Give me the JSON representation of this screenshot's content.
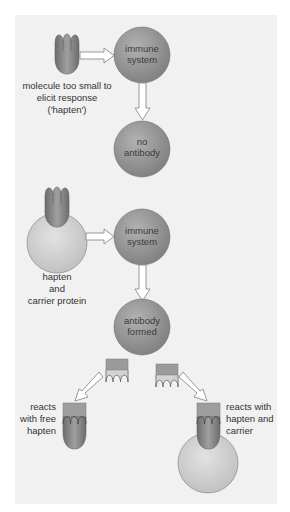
{
  "colors": {
    "panel": "#f1f1f1",
    "circle": "#8f8f8f",
    "circle_light": "#b4b4b4",
    "carrier": "#c9c9c9",
    "carrier_light": "#e4e4e4",
    "hapten": "#7a7a7a",
    "hapten_light": "#a5a5a5",
    "fab_box": "#9d9d9d",
    "arrow_fill": "#ffffff",
    "arrow_stroke": "#8c8c8c",
    "text": "#333333"
  },
  "nodes": {
    "immune_system_1": [
      "immune",
      "system"
    ],
    "no_antibody": [
      "no",
      "antibody"
    ],
    "immune_system_2": [
      "immune",
      "system"
    ],
    "antibody_formed": [
      "antibody",
      "formed"
    ]
  },
  "labels": {
    "hapten_alone": [
      "molecule too small to",
      "elicit response",
      "('hapten')"
    ],
    "hapten_carrier": [
      "hapten",
      "and",
      "carrier protein"
    ],
    "reacts_free": [
      "reacts",
      "with free",
      "hapten"
    ],
    "reacts_carrier": [
      "reacts with",
      "hapten and",
      "carrier"
    ]
  }
}
